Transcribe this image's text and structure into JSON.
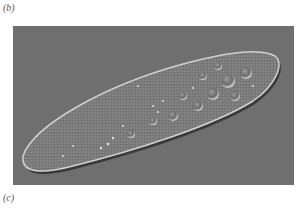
{
  "figure": {
    "panel_labels": {
      "top": "(b)",
      "bottom": "(c)"
    },
    "photo": {
      "subject": "paramecium-micrograph",
      "background_color": "#6f6f6f",
      "cell_color": "#8a8a8a",
      "highlight_color": "#d8d8d8"
    }
  }
}
